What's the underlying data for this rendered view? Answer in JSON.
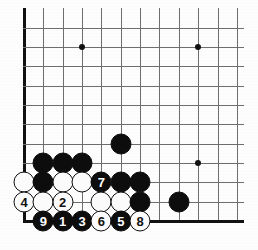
{
  "diagram": {
    "type": "go-board-diagram",
    "colors": {
      "board_background": "#fdfdfd",
      "grid_line": "#6e6e6e",
      "edge_line": "#111111",
      "black_stone": "#0d0d0d",
      "white_stone": "#fbfbfb",
      "black_label_text": "#ffffff",
      "white_label_text": "#111111"
    },
    "geometry": {
      "origin_x": 24,
      "origin_y": 221,
      "cell": 19.35,
      "stone_diameter": 21,
      "columns_visible": 12,
      "rows_visible": 11,
      "left_edge_is_board_edge": true,
      "bottom_edge_is_board_edge": true,
      "top_cut_off": true,
      "right_cut_off": true
    },
    "star_points": [
      {
        "label": "star-point-left",
        "col": 4,
        "row": 10
      },
      {
        "label": "star-point-right",
        "col": 10,
        "row": 10
      },
      {
        "label": "star-point-lower-right",
        "col": 10,
        "row": 4
      }
    ],
    "stones": [
      {
        "id": "b-c2r4",
        "color": "black",
        "col": 2,
        "row": 4,
        "label": ""
      },
      {
        "id": "b-c3r4",
        "color": "black",
        "col": 3,
        "row": 4,
        "label": ""
      },
      {
        "id": "b-c4r4",
        "color": "black",
        "col": 4,
        "row": 4,
        "label": ""
      },
      {
        "id": "b-c6r5",
        "color": "black",
        "col": 6,
        "row": 5,
        "label": ""
      },
      {
        "id": "w-c1r3",
        "color": "white",
        "col": 1,
        "row": 3,
        "label": ""
      },
      {
        "id": "b-c2r3",
        "color": "black",
        "col": 2,
        "row": 3,
        "label": ""
      },
      {
        "id": "w-c3r3",
        "color": "white",
        "col": 3,
        "row": 3,
        "label": ""
      },
      {
        "id": "w-c4r3",
        "color": "white",
        "col": 4,
        "row": 3,
        "label": ""
      },
      {
        "id": "b-c5r3",
        "color": "black",
        "col": 5,
        "row": 3,
        "label": "7"
      },
      {
        "id": "b-c6r3",
        "color": "black",
        "col": 6,
        "row": 3,
        "label": ""
      },
      {
        "id": "b-c7r3",
        "color": "black",
        "col": 7,
        "row": 3,
        "label": ""
      },
      {
        "id": "w-c1r2",
        "color": "white",
        "col": 1,
        "row": 2,
        "label": "4"
      },
      {
        "id": "w-c2r2",
        "color": "white",
        "col": 2,
        "row": 2,
        "label": ""
      },
      {
        "id": "w-c3r2",
        "color": "white",
        "col": 3,
        "row": 2,
        "label": "2"
      },
      {
        "id": "w-c5r2",
        "color": "white",
        "col": 5,
        "row": 2,
        "label": ""
      },
      {
        "id": "w-c6r2",
        "color": "white",
        "col": 6,
        "row": 2,
        "label": ""
      },
      {
        "id": "b-c7r2",
        "color": "black",
        "col": 7,
        "row": 2,
        "label": ""
      },
      {
        "id": "b-c9r2",
        "color": "black",
        "col": 9,
        "row": 2,
        "label": ""
      },
      {
        "id": "b-c2r1",
        "color": "black",
        "col": 2,
        "row": 1,
        "label": "9"
      },
      {
        "id": "b-c3r1",
        "color": "black",
        "col": 3,
        "row": 1,
        "label": "1"
      },
      {
        "id": "b-c4r1",
        "color": "black",
        "col": 4,
        "row": 1,
        "label": "3"
      },
      {
        "id": "w-c5r1",
        "color": "white",
        "col": 5,
        "row": 1,
        "label": "6"
      },
      {
        "id": "b-c6r1",
        "color": "black",
        "col": 6,
        "row": 1,
        "label": "5"
      },
      {
        "id": "w-c7r1",
        "color": "white",
        "col": 7,
        "row": 1,
        "label": "8"
      }
    ],
    "move_sequence": [
      {
        "number": "1",
        "color": "black"
      },
      {
        "number": "2",
        "color": "white"
      },
      {
        "number": "3",
        "color": "black"
      },
      {
        "number": "4",
        "color": "white"
      },
      {
        "number": "5",
        "color": "black"
      },
      {
        "number": "6",
        "color": "white"
      },
      {
        "number": "7",
        "color": "black"
      },
      {
        "number": "8",
        "color": "white"
      },
      {
        "number": "9",
        "color": "black"
      }
    ]
  }
}
